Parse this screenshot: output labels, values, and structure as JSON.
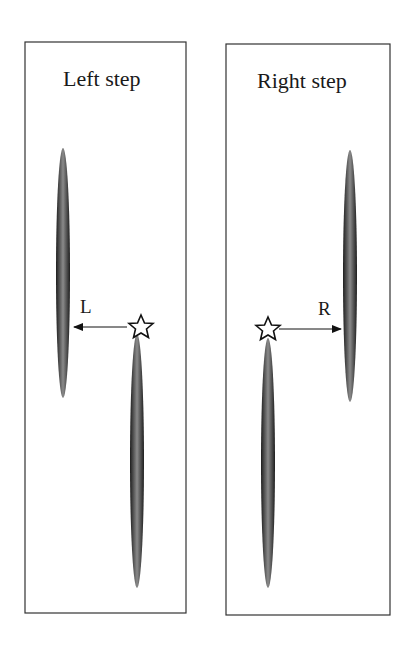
{
  "panels": [
    {
      "title": "Left step",
      "arrow_label": "L",
      "direction": "left"
    },
    {
      "title": "Right step",
      "arrow_label": "R",
      "direction": "right"
    }
  ],
  "icons": {
    "marker": "star-icon"
  },
  "colors": {
    "border": "#333333",
    "foot": "#2b2b2b",
    "foot_highlight": "#8a8a8a"
  }
}
